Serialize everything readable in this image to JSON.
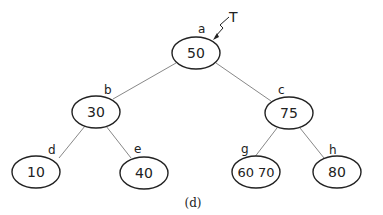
{
  "diagram": {
    "type": "tree",
    "pointer": {
      "label": "T",
      "target": "a"
    },
    "caption": "(d)",
    "nodes": [
      {
        "id": "a",
        "label": "a",
        "keys": "50",
        "cx": 196,
        "cy": 53
      },
      {
        "id": "b",
        "label": "b",
        "keys": "30",
        "cx": 96,
        "cy": 111
      },
      {
        "id": "c",
        "label": "c",
        "keys": "75",
        "cx": 288,
        "cy": 113
      },
      {
        "id": "d",
        "label": "d",
        "keys": "10",
        "cx": 36,
        "cy": 171
      },
      {
        "id": "e",
        "label": "e",
        "keys": "40",
        "cx": 143,
        "cy": 172
      },
      {
        "id": "g",
        "label": "g",
        "keys": "60 70",
        "cx": 256,
        "cy": 172
      },
      {
        "id": "h",
        "label": "h",
        "keys": "80",
        "cx": 336,
        "cy": 172
      }
    ],
    "edges": [
      {
        "from": "a",
        "to": "b"
      },
      {
        "from": "a",
        "to": "c"
      },
      {
        "from": "b",
        "to": "d"
      },
      {
        "from": "b",
        "to": "e"
      },
      {
        "from": "c",
        "to": "g"
      },
      {
        "from": "c",
        "to": "h"
      }
    ],
    "colors": {
      "stroke": "#222222",
      "edge": "#888888",
      "background": "#ffffff"
    }
  }
}
